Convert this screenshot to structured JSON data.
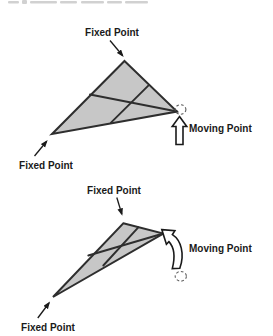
{
  "palette": {
    "background": "#ffffff",
    "triangle_fill": "#c7c7c7",
    "outline": "#2e2e2e",
    "label_text": "#1a1a1a",
    "dashed_circle": "#5f5f5f",
    "block_arrow_fill": "#ffffff"
  },
  "diagram_top": {
    "fixed_point_top_label": "Fixed Point",
    "fixed_point_bottom_label": "Fixed Point",
    "moving_point_label": "Moving Point"
  },
  "diagram_bottom": {
    "fixed_point_top_label": "Fixed Point",
    "fixed_point_bottom_label": "Fixed Point",
    "moving_point_label": "Moving Point"
  }
}
